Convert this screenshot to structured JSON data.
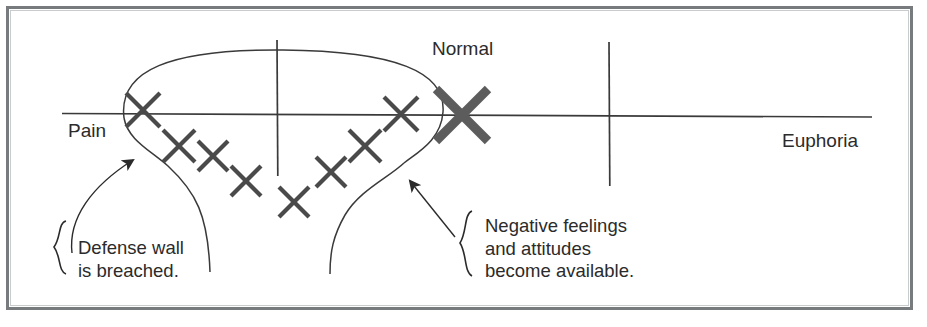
{
  "figure": {
    "type": "conceptual-diagram",
    "top_fragment_text": "",
    "axis": {
      "left_label": "Pain",
      "right_label": "Euphoria",
      "center_label": "Normal",
      "y": 114,
      "x_start": 62,
      "x_end": 872,
      "ticks": [
        {
          "name": "tick-left",
          "x": 277,
          "y_top": 40,
          "y_bottom": 176
        },
        {
          "name": "tick-right",
          "x": 609,
          "y_top": 42,
          "y_bottom": 186
        }
      ]
    },
    "normal_marker": {
      "label": "Normal",
      "x": 462,
      "y": 115,
      "size": 52,
      "stroke_width": 9,
      "color": "#5c5c5c"
    },
    "data_marks": {
      "glyph": "X",
      "color": "#4a4a4a",
      "stroke_width": 4.2,
      "points": [
        {
          "x": 143,
          "y": 110,
          "size": 34
        },
        {
          "x": 179,
          "y": 146,
          "size": 32
        },
        {
          "x": 213,
          "y": 156,
          "size": 30
        },
        {
          "x": 246,
          "y": 181,
          "size": 30
        },
        {
          "x": 294,
          "y": 202,
          "size": 30
        },
        {
          "x": 331,
          "y": 172,
          "size": 30
        },
        {
          "x": 365,
          "y": 146,
          "size": 31
        },
        {
          "x": 401,
          "y": 114,
          "size": 34
        }
      ]
    },
    "enclosure": {
      "name": "defense-wall-envelope",
      "description": "oval over marks with two descending walls",
      "color": "#3a3a3a"
    },
    "callouts": [
      {
        "name": "defense-wall-callout",
        "lines": [
          "Defense wall",
          "is breached."
        ],
        "brace": "{",
        "arrow_to_x": 138,
        "arrow_to_y": 156
      },
      {
        "name": "negative-feelings-callout",
        "lines": [
          "Negative feelings",
          "and attitudes",
          "become available."
        ],
        "brace": "{",
        "arrow_to_x": 404,
        "arrow_to_y": 175
      }
    ],
    "colors": {
      "frame": "#777b7d",
      "ink": "#2b2b2b",
      "mark": "#4a4a4a",
      "normal_mark": "#5c5c5c",
      "thin_line": "#3a3a3a",
      "background": "#ffffff"
    }
  }
}
